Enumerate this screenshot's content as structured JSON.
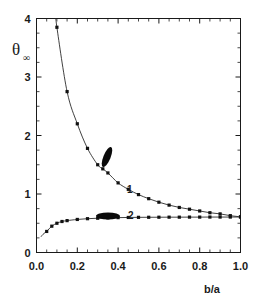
{
  "chart_data": {
    "type": "line",
    "title": "",
    "xlabel": "b/a",
    "ylabel": "θ",
    "ylabel_subscript": "∞",
    "xlim": [
      0.0,
      1.0
    ],
    "ylim": [
      0.0,
      4.0
    ],
    "grid": false,
    "legend_position": "inline-curve-labels",
    "x_ticks": [
      "0.0",
      "0.2",
      "0.4",
      "0.6",
      "0.8",
      "1.0"
    ],
    "x_tick_values": [
      0.0,
      0.2,
      0.4,
      0.6,
      0.8,
      1.0
    ],
    "x_minor_interval": 0.05,
    "y_ticks": [
      "0",
      "1",
      "2",
      "3",
      "4"
    ],
    "y_tick_values": [
      0,
      1,
      2,
      3,
      4
    ],
    "y_minor_interval": 0.25,
    "series": [
      {
        "name": "1",
        "label": "1",
        "marker": "square",
        "annotation": "tilted elongated ellipse (prolate spheroid, inclined)",
        "x": [
          0.1,
          0.15,
          0.2,
          0.25,
          0.3,
          0.325,
          0.35,
          0.4,
          0.45,
          0.5,
          0.55,
          0.6,
          0.65,
          0.7,
          0.75,
          0.8,
          0.85,
          0.9,
          0.95,
          1.0
        ],
        "y": [
          3.85,
          2.75,
          2.2,
          1.78,
          1.5,
          1.43,
          1.36,
          1.19,
          1.08,
          0.99,
          0.92,
          0.86,
          0.81,
          0.77,
          0.74,
          0.71,
          0.68,
          0.66,
          0.63,
          0.61
        ]
      },
      {
        "name": "2",
        "label": "2",
        "marker": "square",
        "annotation": "flat horizontal ellipse (oblate spheroid)",
        "x": [
          0.05,
          0.075,
          0.1,
          0.125,
          0.15,
          0.2,
          0.25,
          0.3,
          0.35,
          0.4,
          0.45,
          0.5,
          0.55,
          0.6,
          0.65,
          0.7,
          0.75,
          0.8,
          0.85,
          0.9,
          0.95,
          1.0
        ],
        "y": [
          0.36,
          0.45,
          0.5,
          0.53,
          0.545,
          0.565,
          0.578,
          0.586,
          0.592,
          0.596,
          0.599,
          0.601,
          0.602,
          0.603,
          0.604,
          0.604,
          0.605,
          0.605,
          0.606,
          0.606,
          0.606,
          0.607
        ]
      }
    ],
    "curve1_asymptote_note": "diverges as b/a -> 0",
    "curve2_start_value": 0.25,
    "colors": {
      "curve": "#2b2b2b",
      "marker": "#111111",
      "axis": "#1a1a1a",
      "background": "#ffffff"
    }
  },
  "labels": {
    "curve1": "1",
    "curve2": "2",
    "x_axis_title": "b/a",
    "y_axis_symbol": "θ",
    "y_axis_subscript": "∞"
  }
}
